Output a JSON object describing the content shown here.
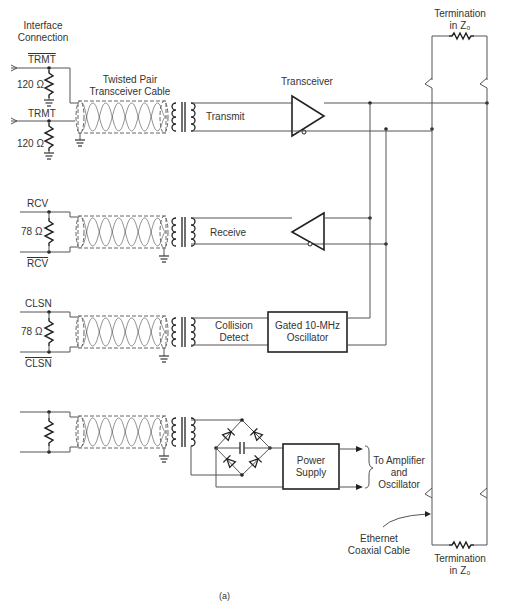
{
  "figure_label": "(a)",
  "interface": {
    "title_line1": "Interface",
    "title_line2": "Connection",
    "cable_line1": "Twisted Pair",
    "cable_line2": "Transceiver Cable"
  },
  "signals": {
    "trmt_bar": "TRMT",
    "trmt": "TRMT",
    "r_trmt_bar": "120 Ω",
    "r_trmt": "120 Ω",
    "rcv": "RCV",
    "rcv_bar": "RCV",
    "r_rcv": "78 Ω",
    "clsn": "CLSN",
    "clsn_bar": "CLSN",
    "r_clsn": "78 Ω"
  },
  "channels": {
    "transmit": "Transmit",
    "receive": "Receive",
    "collision_line1": "Collision",
    "collision_line2": "Detect"
  },
  "blocks": {
    "transceiver": "Transceiver",
    "oscillator_line1": "Gated 10-MHz",
    "oscillator_line2": "Oscillator",
    "power_line1": "Power",
    "power_line2": "Supply",
    "to_amp_line1": "To Amplifier",
    "to_amp_line2": "and",
    "to_amp_line3": "Oscillator"
  },
  "coax": {
    "term_top_line1": "Termination",
    "term_top_line2": "in Z₀",
    "term_bottom_line1": "Termination",
    "term_bottom_line2": "in Z₀",
    "cable_line1": "Ethernet",
    "cable_line2": "Coaxial Cable"
  },
  "colors": {
    "ink": "#222222",
    "wire": "#555555",
    "background": "#ffffff"
  }
}
